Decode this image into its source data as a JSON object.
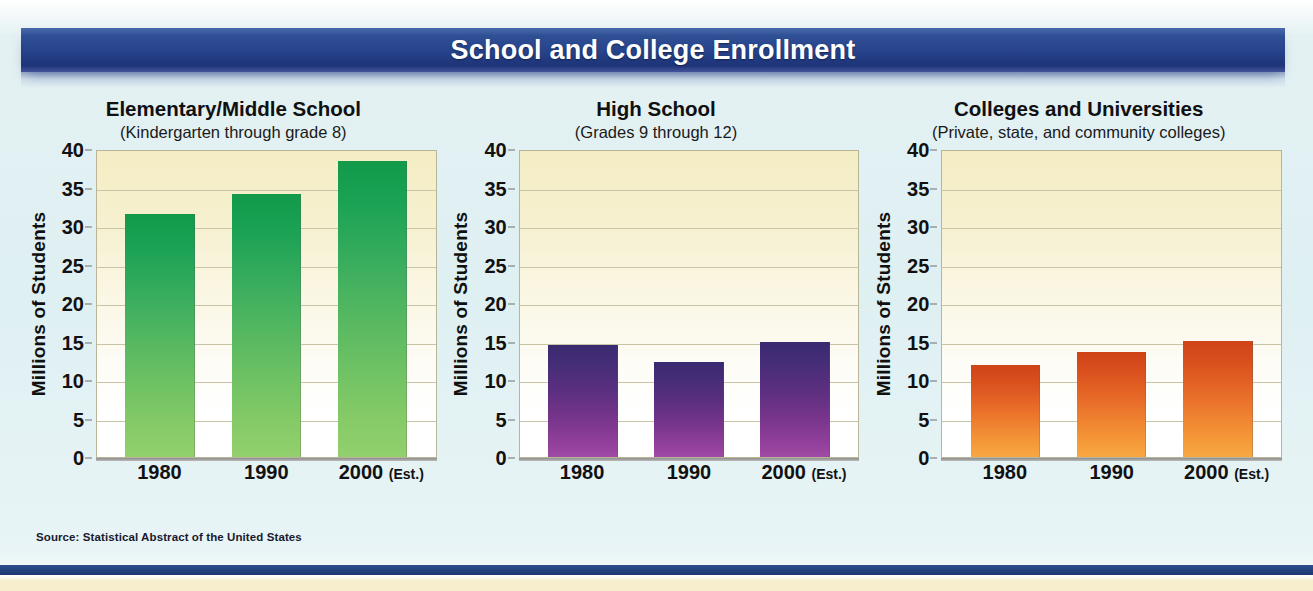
{
  "banner": {
    "title": "School and College Enrollment",
    "color": "#26428a"
  },
  "source": "Source: Statistical Abstract of the United States",
  "axis": {
    "ylabel": "Millions of Students",
    "ticks": [
      "40",
      "35",
      "30",
      "25",
      "20",
      "15",
      "10",
      "5",
      "0"
    ],
    "ymin": 0,
    "ymax": 40,
    "step": 5
  },
  "categories": [
    "1980",
    "1990",
    "2000"
  ],
  "category_notes": [
    "",
    "",
    "(Est.)"
  ],
  "panels": [
    {
      "title": "Elementary/Middle School",
      "subtitle": "(Kindergarten through grade 8)",
      "series_color": "#2aa85a",
      "ylabel": "Millions of Students",
      "values": [
        31.5,
        34.1,
        38.4
      ]
    },
    {
      "title": "High School",
      "subtitle": "(Grades 9 through 12)",
      "series_color": "#6b3487",
      "ylabel": "Millions of Students",
      "values": [
        14.6,
        12.4,
        15.0
      ]
    },
    {
      "title": "Colleges and Universities",
      "subtitle": "(Private, state, and community colleges)",
      "series_color": "#e8742a",
      "ylabel": "Millions of Students",
      "values": [
        12.0,
        13.6,
        15.1
      ]
    }
  ],
  "chart_data": [
    {
      "type": "bar",
      "title": "Elementary/Middle School",
      "subtitle": "(Kindergarten through grade 8)",
      "categories": [
        "1980",
        "1990",
        "2000 (Est.)"
      ],
      "values": [
        31.5,
        34.1,
        38.4
      ],
      "xlabel": "",
      "ylabel": "Millions of Students",
      "ylim": [
        0,
        40
      ],
      "ytick_step": 5,
      "grid": true,
      "legend": "none",
      "series_color": "#2aa85a"
    },
    {
      "type": "bar",
      "title": "High School",
      "subtitle": "(Grades 9 through 12)",
      "categories": [
        "1980",
        "1990",
        "2000 (Est.)"
      ],
      "values": [
        14.6,
        12.4,
        15.0
      ],
      "xlabel": "",
      "ylabel": "Millions of Students",
      "ylim": [
        0,
        40
      ],
      "ytick_step": 5,
      "grid": true,
      "legend": "none",
      "series_color": "#6b3487"
    },
    {
      "type": "bar",
      "title": "Colleges and Universities",
      "subtitle": "(Private, state, and community colleges)",
      "categories": [
        "1980",
        "1990",
        "2000 (Est.)"
      ],
      "values": [
        12.0,
        13.6,
        15.1
      ],
      "xlabel": "",
      "ylabel": "Millions of Students",
      "ylim": [
        0,
        40
      ],
      "ytick_step": 5,
      "grid": true,
      "legend": "none",
      "series_color": "#e8742a"
    }
  ]
}
